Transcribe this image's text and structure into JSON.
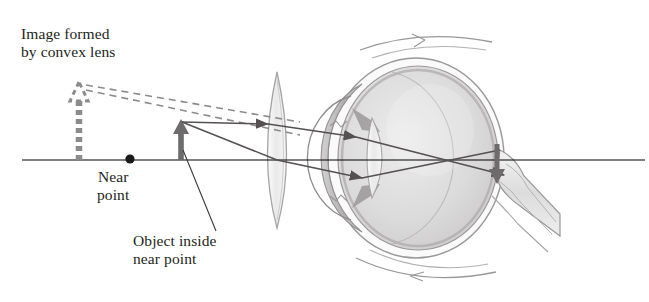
{
  "figure": {
    "title_label": "Image formed\nby convex lens",
    "near_point_label": "Near\npoint",
    "object_label": "Object inside\nnear point",
    "colors": {
      "ink": "#231f20",
      "axis": "#000000",
      "gray_ray": "#555052",
      "dashed_image": "#8d8a8c",
      "object_arrow": "#6e6b6d",
      "eye_outline": "#8e8b8d",
      "sclera": "#f2f1f1",
      "vitreous": "#d9d8d8",
      "cornea": "#b9b7b8",
      "lens_fill": "#ededed"
    },
    "parts": [
      {
        "name": "optical-axis",
        "type": "line"
      },
      {
        "name": "virtual-image-arrow",
        "type": "dashed-arrow-up"
      },
      {
        "name": "near-point-dot",
        "type": "dot"
      },
      {
        "name": "object-arrow",
        "type": "arrow-up"
      },
      {
        "name": "convex-lens",
        "type": "biconvex-lens"
      },
      {
        "name": "eyeball",
        "type": "eye"
      },
      {
        "name": "retinal-image-arrow",
        "type": "arrow-down"
      },
      {
        "name": "optic-nerve",
        "type": "tube"
      },
      {
        "name": "ray-upper",
        "type": "ray"
      },
      {
        "name": "ray-lower",
        "type": "ray"
      },
      {
        "name": "dashed-extension-upper",
        "type": "dashed-ray"
      },
      {
        "name": "dashed-extension-lower",
        "type": "dashed-ray"
      },
      {
        "name": "leader-line-object",
        "type": "leader"
      }
    ]
  }
}
